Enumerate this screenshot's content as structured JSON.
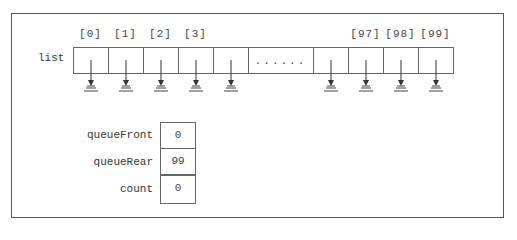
{
  "diagram": {
    "type": "array-based queue memory layout",
    "list": {
      "label": "list",
      "indices": [
        "[0]",
        "[1]",
        "[2]",
        "[3]",
        "[97]",
        "[98]",
        "[99]"
      ],
      "ellipsis": "......",
      "cells_note": "each cell points to ground (null)"
    },
    "fields": [
      {
        "label": "queueFront",
        "value": "0"
      },
      {
        "label": "queueRear",
        "value": "99"
      },
      {
        "label": "count",
        "value": "0"
      }
    ],
    "icons": {
      "null_pointer": "ground-icon"
    }
  }
}
